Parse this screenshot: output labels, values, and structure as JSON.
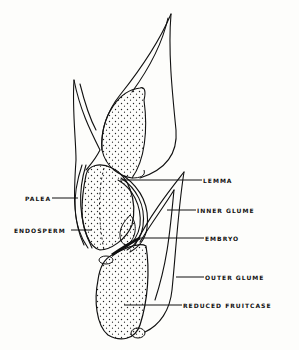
{
  "diagram": {
    "labels": {
      "lemma": "LEMMA",
      "palea": "PALEA",
      "inner_glume": "INNER GLUME",
      "endosperm": "ENDOSPERM",
      "embryo": "EMBRYO",
      "outer_glume": "OUTER GLUME",
      "reduced_fruitcase": "REDUCED FRUITCASE"
    },
    "colors": {
      "ink": "#111111",
      "background": "#fdfdfb"
    }
  }
}
